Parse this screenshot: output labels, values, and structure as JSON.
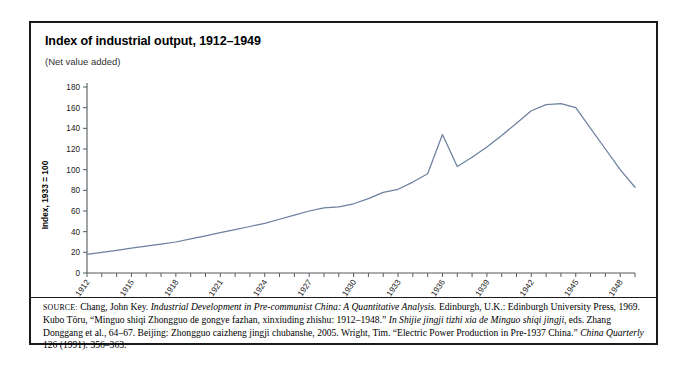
{
  "figure": {
    "title": "Index of industrial output, 1912–1949",
    "subtitle": "(Net value added)"
  },
  "source": {
    "label": "SOURCE:",
    "part1": " Chang, John Key. ",
    "work1": "Industrial Development in Pre-communist China: A Quantitative Analysis.",
    "part2": " Edinburgh, U.K.: Edinburgh University Press, 1969. Kubo Tōru, “Minguo shiqi Zhongguo de gongye fazhan, xinxiuding zhishu: 1912–1948.” ",
    "work2": "In Shijie jingji tizhi xia de Minguo shiqi jingji",
    "part3": ", eds. Zhang Donggang et al., 64–67. Beijing: Zhongguo caizheng jingji chubanshe, 2005. Wright, Tim. “Electric Power Production in Pre-1937 China.” ",
    "work3": "China Quarterly",
    "part4": " 126 (1991): 356–363."
  },
  "chart_data": {
    "type": "line",
    "title": "Index of industrial output, 1912–1949",
    "subtitle": "(Net value added)",
    "xlabel": "",
    "ylabel": "Index, 1933 = 100",
    "xlim": [
      1912,
      1949
    ],
    "ylim": [
      0,
      180
    ],
    "yticks": [
      0,
      20,
      40,
      60,
      80,
      100,
      120,
      140,
      160,
      180
    ],
    "xticks": [
      1912,
      1913,
      1914,
      1915,
      1916,
      1917,
      1918,
      1919,
      1920,
      1921,
      1922,
      1923,
      1924,
      1925,
      1926,
      1927,
      1928,
      1929,
      1930,
      1931,
      1932,
      1933,
      1934,
      1935,
      1936,
      1937,
      1938,
      1939,
      1940,
      1941,
      1942,
      1943,
      1944,
      1945,
      1946,
      1947,
      1948,
      1949
    ],
    "xtick_labels_shown": [
      1912,
      1915,
      1918,
      1921,
      1924,
      1927,
      1930,
      1933,
      1936,
      1939,
      1942,
      1945,
      1948
    ],
    "grid": false,
    "legend": false,
    "line_color": "#6c809f",
    "series": [
      {
        "name": "Index of industrial output",
        "x": [
          1912,
          1913,
          1914,
          1915,
          1916,
          1917,
          1918,
          1919,
          1920,
          1921,
          1922,
          1923,
          1924,
          1925,
          1926,
          1927,
          1928,
          1929,
          1930,
          1931,
          1932,
          1933,
          1934,
          1935,
          1936,
          1937,
          1938,
          1939,
          1940,
          1941,
          1942,
          1943,
          1944,
          1945,
          1946,
          1947,
          1948,
          1949
        ],
        "values": [
          18,
          20,
          22,
          24,
          26,
          28,
          30,
          33,
          36,
          39,
          42,
          45,
          48,
          52,
          56,
          60,
          63,
          64,
          67,
          72,
          78,
          81,
          88,
          96,
          134,
          103,
          112,
          122,
          133,
          145,
          157,
          163,
          164,
          160,
          140,
          120,
          100,
          83
        ]
      }
    ]
  }
}
